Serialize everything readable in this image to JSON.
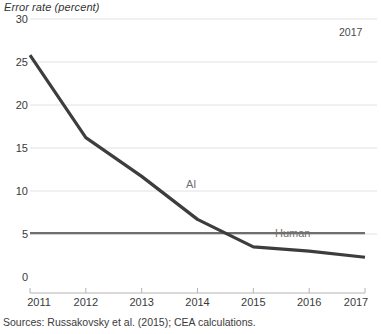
{
  "chart_data": {
    "type": "line",
    "title": "",
    "ylabel": "Error rate (percent)",
    "xlabel": "",
    "x": [
      2011,
      2012,
      2013,
      2014,
      2015,
      2016,
      2017
    ],
    "xlim": [
      2011,
      2017
    ],
    "ylim": [
      0,
      30
    ],
    "yticks": [
      0,
      5,
      10,
      15,
      20,
      25,
      30
    ],
    "ytick_labels": [
      "0",
      "5",
      "10",
      "15",
      "20",
      "25",
      "30"
    ],
    "xtick_labels": [
      "2011",
      "2012",
      "2013",
      "2014",
      "2015",
      "2016",
      "2017"
    ],
    "grid": "horizontal",
    "legend": "inline-labels",
    "series": [
      {
        "name": "AI",
        "label": "AI",
        "color": "#3d3d3d",
        "values": [
          25.8,
          16.2,
          11.7,
          6.7,
          3.5,
          3.0,
          2.3
        ]
      },
      {
        "name": "Human",
        "label": "Human",
        "color": "#6e6e6e",
        "values": [
          5.1,
          5.1,
          5.1,
          5.1,
          5.1,
          5.1,
          5.1
        ]
      }
    ],
    "annotations": [
      {
        "name": "corner-year",
        "text": "2017"
      }
    ],
    "source_note": "Sources: Russakovsky et al. (2015); CEA calculations.",
    "colors": {
      "ai_line": "#3d3d3d",
      "human_line": "#6e6e6e",
      "gridline": "#e2e2e2",
      "axis": "#b4b4b4",
      "text": "#3a3a3a",
      "label_text": "#6f6f6f"
    }
  },
  "geometry": {
    "plot_left": 30,
    "plot_right": 365,
    "y_zero_px": 277,
    "y_top_px": 19,
    "y_max_value": 30,
    "axis_line_y": 293,
    "tick_top_y": 288
  }
}
